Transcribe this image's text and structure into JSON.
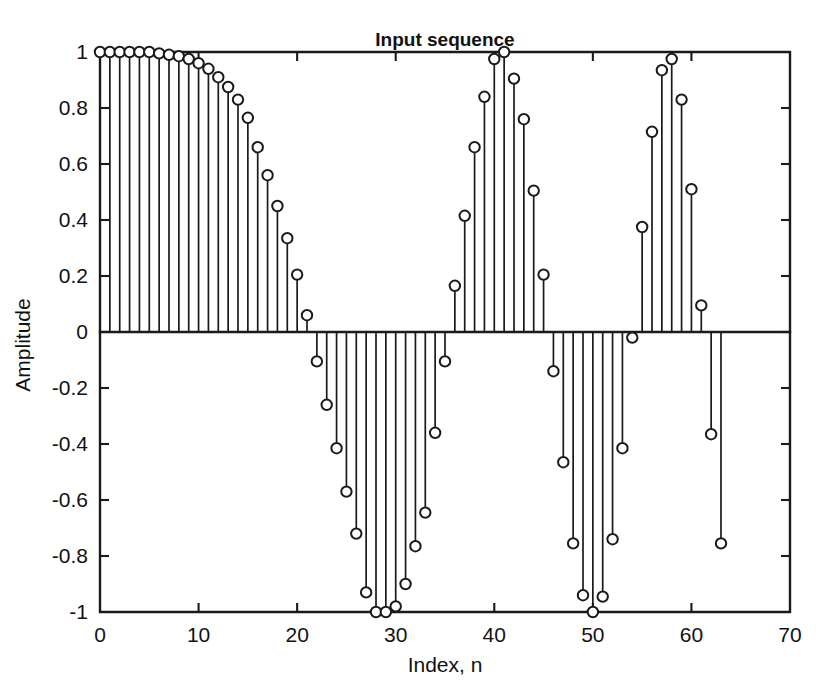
{
  "figure": {
    "name": "input-sequence-stem-plot",
    "background_color": "#ffffff",
    "foreground_color": "#1a1a1a"
  },
  "chart_data": {
    "type": "scatter",
    "subtype": "stem",
    "title": "Input sequence",
    "xlabel": "Index, n",
    "ylabel": "Amplitude",
    "xlim": [
      0,
      70
    ],
    "ylim": [
      -1,
      1
    ],
    "xticks": [
      0,
      10,
      20,
      30,
      40,
      50,
      60,
      70
    ],
    "xticklabels": [
      "0",
      "10",
      "20",
      "30",
      "40",
      "50",
      "60",
      "70"
    ],
    "yticks": [
      -1,
      -0.8,
      -0.6,
      -0.4,
      -0.2,
      0,
      0.2,
      0.4,
      0.6,
      0.8,
      1
    ],
    "yticklabels": [
      "-1",
      "-0.8",
      "-0.6",
      "-0.4",
      "-0.2",
      "0",
      "0.2",
      "0.4",
      "0.6",
      "0.8",
      "1"
    ],
    "grid": false,
    "legend": false,
    "marker": "open-circle",
    "baseline": 0,
    "x": [
      0,
      1,
      2,
      3,
      4,
      5,
      6,
      7,
      8,
      9,
      10,
      11,
      12,
      13,
      14,
      15,
      16,
      17,
      18,
      19,
      20,
      21,
      22,
      23,
      24,
      25,
      26,
      27,
      28,
      29,
      30,
      31,
      32,
      33,
      34,
      35,
      36,
      37,
      38,
      39,
      40,
      41,
      42,
      43,
      44,
      45,
      46,
      47,
      48,
      49,
      50,
      51,
      52,
      53,
      54,
      55,
      56,
      57,
      58,
      59,
      60,
      61,
      62,
      63
    ],
    "y": [
      1.0,
      1.0,
      1.0,
      1.0,
      1.0,
      1.0,
      0.995,
      0.99,
      0.985,
      0.975,
      0.96,
      0.94,
      0.91,
      0.875,
      0.83,
      0.765,
      0.66,
      0.56,
      0.45,
      0.335,
      0.205,
      0.06,
      -0.105,
      -0.26,
      -0.415,
      -0.57,
      -0.72,
      -0.93,
      -1.0,
      -1.0,
      -0.98,
      -0.9,
      -0.765,
      -0.645,
      -0.36,
      -0.105,
      0.165,
      0.415,
      0.66,
      0.84,
      0.975,
      1.0,
      0.905,
      0.76,
      0.505,
      0.205,
      -0.14,
      -0.465,
      -0.755,
      -0.94,
      -1.0,
      -0.945,
      -0.74,
      -0.415,
      -0.02,
      0.375,
      0.715,
      0.935,
      0.975,
      0.83,
      0.51,
      0.095,
      -0.365,
      -0.755
    ],
    "series": [
      {
        "name": "Input sequence",
        "values": [
          1.0,
          1.0,
          1.0,
          1.0,
          1.0,
          1.0,
          0.995,
          0.99,
          0.985,
          0.975,
          0.96,
          0.94,
          0.91,
          0.875,
          0.83,
          0.765,
          0.66,
          0.56,
          0.45,
          0.335,
          0.205,
          0.06,
          -0.105,
          -0.26,
          -0.415,
          -0.57,
          -0.72,
          -0.93,
          -1.0,
          -1.0,
          -0.98,
          -0.9,
          -0.765,
          -0.645,
          -0.36,
          -0.105,
          0.165,
          0.415,
          0.66,
          0.84,
          0.975,
          1.0,
          0.905,
          0.76,
          0.505,
          0.205,
          -0.14,
          -0.465,
          -0.755,
          -0.94,
          -1.0,
          -0.945,
          -0.74,
          -0.415,
          -0.02,
          0.375,
          0.715,
          0.935,
          0.975,
          0.83,
          0.51,
          0.095,
          -0.365,
          -0.755
        ]
      }
    ]
  }
}
